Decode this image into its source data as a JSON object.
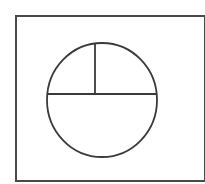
{
  "diagram": {
    "type": "circle-divided-by-chords",
    "colors": {
      "background": "#ffffff",
      "stroke": "#3a3a3a",
      "frame": "#4a4a4a"
    },
    "frame": {
      "x": 16,
      "y": 16,
      "width": 189,
      "height": 165
    },
    "circle": {
      "cx": 102,
      "cy": 100,
      "rx": 55,
      "ry": 57
    },
    "horizontal_chord": {
      "x1": 47.5,
      "y1": 94,
      "x2": 156.5,
      "y2": 94
    },
    "vertical_segment": {
      "x1": 95,
      "y1": 43.5,
      "x2": 95,
      "y2": 94
    },
    "regions": [
      "upper-left",
      "upper-right",
      "lower"
    ]
  }
}
